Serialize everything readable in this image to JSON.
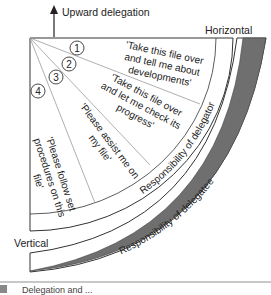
{
  "diagram": {
    "top_label": "Upward delegation",
    "horizontal_label": "Horizontal",
    "vertical_label": "Vertical",
    "inner_arc_label": "Responsibility of delegator",
    "outer_arc_label": "Responsibility of delegatee",
    "levels": [
      {
        "number": "1",
        "quote_lines": [
          "'Take this file over",
          "and tell me about",
          "developments'"
        ]
      },
      {
        "number": "2",
        "quote_lines": [
          "'Take this file over",
          "and let me check its",
          "progress'"
        ]
      },
      {
        "number": "3",
        "quote_lines": [
          "'Please assist me on",
          "my file'"
        ]
      },
      {
        "number": "4",
        "quote_lines": [
          "'Please follow set",
          "procedures on this",
          "file'"
        ]
      }
    ],
    "colors": {
      "band": "#6f6f6f",
      "line": "#333333",
      "divider": "#9a9a9a"
    }
  },
  "footer": {
    "caption": "Delegation and ..."
  }
}
